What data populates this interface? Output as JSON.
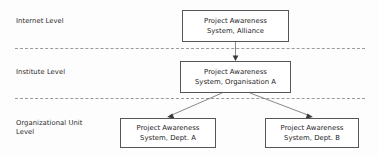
{
  "diagram": {
    "background_color": "#fdfdfd",
    "box_border_color": "#565656",
    "divider_color": "#9a9a9a",
    "connector_color": "#7a7a7a",
    "text_color": "#1d1d1d"
  },
  "tiers": [
    {
      "id": "internet",
      "label": "Internet Level"
    },
    {
      "id": "institute",
      "label": "Institute Level"
    },
    {
      "id": "orgunit",
      "label": "Organizational Unit\nLevel"
    }
  ],
  "nodes": [
    {
      "id": "alliance",
      "label": "Project Awareness\nSystem, Alliance",
      "tier": "internet"
    },
    {
      "id": "organisation",
      "label": "Project Awareness\nSystem, Organisation A",
      "tier": "institute"
    },
    {
      "id": "dept-a",
      "label": "Project Awareness\nSystem, Dept. A",
      "tier": "orgunit"
    },
    {
      "id": "dept-b",
      "label": "Project Awareness\nSystem, Dept. B",
      "tier": "orgunit"
    }
  ],
  "edges": [
    {
      "id": "alliance-to-organisation",
      "from": "alliance",
      "to": "organisation",
      "style": "arrow-down"
    },
    {
      "id": "organisation-to-dept-a",
      "from": "organisation",
      "to": "dept-a",
      "style": "arrow-diagonal-left"
    },
    {
      "id": "organisation-to-dept-b",
      "from": "organisation",
      "to": "dept-b",
      "style": "arrow-diagonal-right"
    }
  ]
}
